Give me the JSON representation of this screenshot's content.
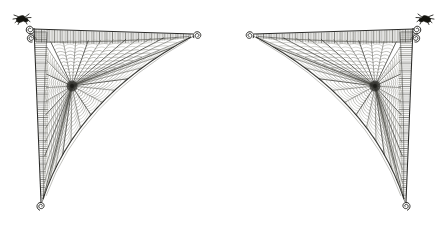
{
  "plate": {
    "title": "Spider Web Plate",
    "description": "Engraving of two mirrored triangular orb webs",
    "width": 447,
    "height": 235,
    "background_color": "#ffffff",
    "ink_color": "#2a2a28",
    "panel_count": 2,
    "symmetry": "mirrored-horizontal"
  },
  "panels": [
    {
      "id": "left-web",
      "name": "Left triangular orb web",
      "orientation": "corner-top-left",
      "corner_x": 33,
      "corner_y": 28,
      "top_anchor_x": 196,
      "top_anchor_y": 33,
      "bottom_anchor_x": 40,
      "bottom_anchor_y": 205,
      "hub_x": 72,
      "hub_y": 86,
      "radial_count": 34,
      "spiral_count": 13,
      "has_spider": true,
      "spider_corner": "top-left",
      "curl_anchors": 3
    },
    {
      "id": "right-web",
      "name": "Right triangular orb web",
      "orientation": "corner-top-right",
      "corner_x": 414,
      "corner_y": 28,
      "top_anchor_x": 251,
      "top_anchor_y": 33,
      "bottom_anchor_x": 407,
      "bottom_anchor_y": 205,
      "hub_x": 375,
      "hub_y": 86,
      "radial_count": 34,
      "spiral_count": 13,
      "has_spider": true,
      "spider_corner": "top-right",
      "curl_anchors": 3
    }
  ],
  "elements": {
    "frame_band_label": "hatched frame band",
    "hub_label": "web hub",
    "radial_label": "radial spoke",
    "spiral_label": "capture spiral thread",
    "curl_label": "spiral curl anchor",
    "spider_label": "spider"
  }
}
